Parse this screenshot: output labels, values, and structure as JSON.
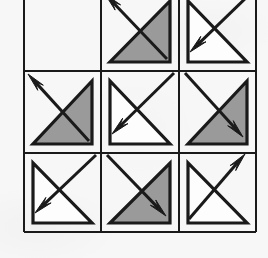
{
  "figure": {
    "kind": "matrix-reasoning-puzzle",
    "background_color": "#f7f7f7",
    "stroke_color": "#1a1a1a",
    "shade_color": "#9a9a9a",
    "blank_color": "#fdfdfd",
    "rows": 3,
    "columns": 3,
    "grid": {
      "left": 24,
      "top": -9,
      "right": 256,
      "bottom": 232,
      "vertical_lines": [
        24,
        101,
        179,
        256
      ],
      "horizontal_lines": [
        -9,
        71,
        153,
        232
      ],
      "line_width": 2.0
    },
    "cells": [
      {
        "index": 1,
        "row": 1,
        "column": 1,
        "name": "cell-r1c1",
        "content": "empty",
        "triangle": null,
        "arrow": null,
        "label": "blank cell"
      },
      {
        "index": 2,
        "row": 1,
        "column": 2,
        "name": "cell-r1c2",
        "content": "triangle-with-arrow",
        "triangle": {
          "fill": "shaded",
          "right_angle_corner": "bottom-right",
          "hypotenuse": "bottom-left-to-top-right"
        },
        "arrow": {
          "direction": "upper-left",
          "from": "bottom-right",
          "to": "top-left"
        },
        "label": "shaded triangle, arrow up-left"
      },
      {
        "index": 3,
        "row": 1,
        "column": 3,
        "name": "cell-r1c3",
        "content": "triangle-with-arrow",
        "triangle": {
          "fill": "unshaded",
          "right_angle_corner": "bottom-left",
          "hypotenuse": "top-left-to-bottom-right"
        },
        "arrow": {
          "direction": "lower-left",
          "from": "top-right",
          "to": "bottom-left"
        },
        "label": "unshaded triangle, arrow down-left"
      },
      {
        "index": 4,
        "row": 2,
        "column": 1,
        "name": "cell-r2c1",
        "content": "triangle-with-arrow",
        "triangle": {
          "fill": "shaded",
          "right_angle_corner": "bottom-right",
          "hypotenuse": "bottom-left-to-top-right"
        },
        "arrow": {
          "direction": "upper-left",
          "from": "bottom-right",
          "to": "top-left"
        },
        "label": "shaded triangle, arrow up-left"
      },
      {
        "index": 5,
        "row": 2,
        "column": 2,
        "name": "cell-r2c2",
        "content": "triangle-with-arrow",
        "triangle": {
          "fill": "unshaded",
          "right_angle_corner": "bottom-left",
          "hypotenuse": "top-left-to-bottom-right"
        },
        "arrow": {
          "direction": "lower-left",
          "from": "top-right",
          "to": "bottom-left"
        },
        "label": "unshaded triangle, arrow down-left"
      },
      {
        "index": 6,
        "row": 2,
        "column": 3,
        "name": "cell-r2c3",
        "content": "triangle-with-arrow",
        "triangle": {
          "fill": "shaded",
          "right_angle_corner": "bottom-right",
          "hypotenuse": "bottom-left-to-top-right"
        },
        "arrow": {
          "direction": "lower-right",
          "from": "top-left",
          "to": "bottom-right"
        },
        "label": "shaded triangle, arrow down-right"
      },
      {
        "index": 7,
        "row": 3,
        "column": 1,
        "name": "cell-r3c1",
        "content": "triangle-with-arrow",
        "triangle": {
          "fill": "unshaded",
          "right_angle_corner": "bottom-left",
          "hypotenuse": "top-left-to-bottom-right"
        },
        "arrow": {
          "direction": "lower-left",
          "from": "top-right",
          "to": "bottom-left"
        },
        "label": "unshaded triangle, arrow down-left"
      },
      {
        "index": 8,
        "row": 3,
        "column": 2,
        "name": "cell-r3c2",
        "content": "triangle-with-arrow",
        "triangle": {
          "fill": "shaded",
          "right_angle_corner": "bottom-right",
          "hypotenuse": "bottom-left-to-top-right"
        },
        "arrow": {
          "direction": "lower-right",
          "from": "top-left",
          "to": "bottom-right"
        },
        "label": "shaded triangle, arrow down-right"
      },
      {
        "index": 9,
        "row": 3,
        "column": 3,
        "name": "cell-r3c3",
        "content": "triangle-with-arrow",
        "triangle": {
          "fill": "unshaded",
          "right_angle_corner": "bottom-left",
          "hypotenuse": "top-left-to-bottom-right"
        },
        "arrow": {
          "direction": "upper-right",
          "from": "bottom-left",
          "to": "top-right"
        },
        "label": "unshaded triangle, arrow up-right"
      }
    ]
  }
}
